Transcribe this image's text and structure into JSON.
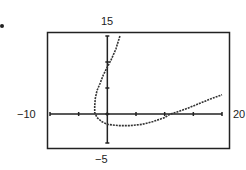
{
  "chart_data": {
    "type": "line",
    "title": "",
    "xlabel": "",
    "ylabel": "",
    "xlim": [
      -10,
      20
    ],
    "ylim": [
      -5,
      15
    ],
    "grid": false,
    "window_labels": {
      "xmin": "−10",
      "xmax": "20",
      "ymin": "−5",
      "ymax": "15"
    },
    "series": [
      {
        "name": "curve",
        "style": "dotted-calculator",
        "points": [
          [
            2.2,
            15
          ],
          [
            1.5,
            12.5
          ],
          [
            0.7,
            10.5
          ],
          [
            0,
            9
          ],
          [
            -0.7,
            7.5
          ],
          [
            -1.3,
            5.8
          ],
          [
            -1.8,
            4.5
          ],
          [
            -2.1,
            3
          ],
          [
            -2.2,
            1.5
          ],
          [
            -2.2,
            0.3
          ],
          [
            -1.8,
            -0.6
          ],
          [
            -1,
            -1.3
          ],
          [
            0,
            -1.8
          ],
          [
            2,
            -2
          ],
          [
            4,
            -2
          ],
          [
            6,
            -1.8
          ],
          [
            8,
            -1.3
          ],
          [
            10,
            -0.6
          ],
          [
            11,
            0
          ],
          [
            12,
            0.3
          ],
          [
            14,
            1.1
          ],
          [
            16,
            2
          ],
          [
            18,
            2.9
          ],
          [
            20,
            3.7
          ]
        ]
      }
    ]
  }
}
